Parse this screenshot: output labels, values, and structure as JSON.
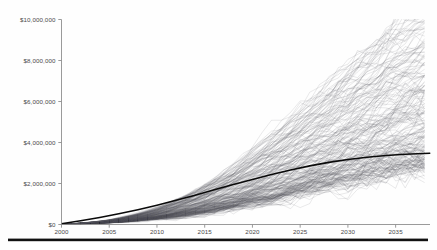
{
  "chart_data": {
    "type": "line",
    "title": "",
    "subtitle": "",
    "xlabel": "",
    "ylabel": "",
    "xlim": [
      2000,
      2038.6
    ],
    "ylim": [
      0,
      10000000
    ],
    "grid": false,
    "legend": null,
    "x_ticks": [
      2000,
      2005,
      2010,
      2015,
      2020,
      2025,
      2030,
      2035
    ],
    "x_tick_labels": [
      "2000",
      "2005",
      "2010",
      "2015",
      "2020",
      "2025",
      "2030",
      "2035"
    ],
    "y_ticks": [
      0,
      2000000,
      4000000,
      6000000,
      8000000,
      10000000
    ],
    "y_tick_labels": [
      "$0",
      "$2,000,000",
      "$4,000,000",
      "$6,000,000",
      "$8,000,000",
      "$10,000,000"
    ],
    "series_count": 220,
    "series_style": "monte-carlo-spaghetti",
    "colors": {
      "simulation_line": "#555a5e",
      "median_line": "#0a0a0a",
      "axis": "#8f8f8f",
      "tick_text": "#4a4a4a",
      "rule_bar": "#111111",
      "background": "#fefefe"
    },
    "series": [
      {
        "name": "median",
        "emphasis": "bold",
        "x": [
          2000,
          2002,
          2004,
          2006,
          2008,
          2010,
          2012,
          2014,
          2016,
          2018,
          2020,
          2022,
          2024,
          2026,
          2028,
          2030,
          2032,
          2034,
          2036,
          2038.6
        ],
        "values": [
          40000,
          180000,
          340000,
          520000,
          720000,
          940000,
          1180000,
          1430000,
          1690000,
          1950000,
          2200000,
          2440000,
          2660000,
          2860000,
          3030000,
          3170000,
          3280000,
          3370000,
          3430000,
          3480000
        ]
      },
      {
        "name": "upper-envelope-p95",
        "emphasis": "normal",
        "x": [
          2000,
          2005,
          2010,
          2015,
          2020,
          2025,
          2030,
          2035,
          2038.6
        ],
        "values": [
          60000,
          900000,
          2200000,
          3900000,
          5900000,
          7800000,
          9300000,
          10200000,
          10400000
        ]
      },
      {
        "name": "lower-envelope-p05",
        "emphasis": "normal",
        "x": [
          2000,
          2005,
          2010,
          2015,
          2020,
          2025,
          2030,
          2035,
          2038.6
        ],
        "values": [
          20000,
          120000,
          230000,
          330000,
          410000,
          470000,
          520000,
          560000,
          580000
        ]
      }
    ],
    "annotations": []
  },
  "footer": {
    "rule": ""
  }
}
